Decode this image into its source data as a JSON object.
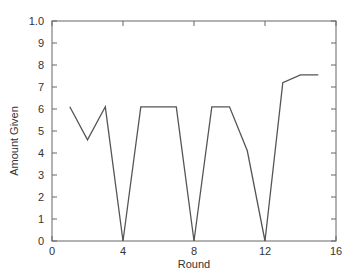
{
  "chart_data": {
    "type": "line",
    "title": "",
    "xlabel": "Round",
    "ylabel": "Amount Given",
    "xlim": [
      0,
      16
    ],
    "ylim": [
      0,
      10
    ],
    "xticks": [
      0,
      4,
      8,
      12,
      16
    ],
    "xtick_labels": [
      "0",
      "4",
      "8",
      "12",
      "16"
    ],
    "yticks": [
      0,
      1,
      2,
      3,
      4,
      5,
      6,
      7,
      8,
      9,
      10
    ],
    "ytick_labels": [
      "0",
      "1",
      "2",
      "3",
      "4",
      "5",
      "6",
      "7",
      "8",
      "9",
      "1.0"
    ],
    "grid": false,
    "legend": null,
    "series": [
      {
        "name": "Amount Given",
        "x": [
          1,
          2,
          3,
          4,
          5,
          6,
          7,
          8,
          9,
          10,
          11,
          12,
          13,
          14,
          15
        ],
        "values": [
          6.1,
          4.6,
          6.1,
          0,
          6.1,
          6.1,
          6.1,
          0,
          6.1,
          6.1,
          4.1,
          0,
          7.2,
          7.55,
          7.55
        ],
        "color": "#555555"
      }
    ]
  },
  "colors": {
    "axis": "#666666",
    "line": "#555555",
    "text": "#333333"
  }
}
